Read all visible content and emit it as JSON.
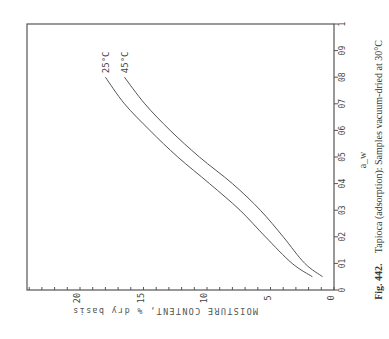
{
  "figure": {
    "caption_number": "Fig. 442.",
    "caption_text": "Tapioca (adsorption): Samples vacuum-dried at 30°C",
    "orientation": "rotated 90° clockwise"
  },
  "chart_data": {
    "type": "line",
    "title": "Tapioca (adsorption): Samples vacuum-dried at 30°C",
    "xlabel": "a_w",
    "ylabel": "MOISTURE CONTENT, % dry basis",
    "xlim": [
      0,
      1
    ],
    "ylim": [
      0,
      24
    ],
    "x_ticks": [
      0,
      0.1,
      0.2,
      0.3,
      0.4,
      0.5,
      0.6,
      0.7,
      0.8,
      0.9,
      1
    ],
    "x_tick_labels": [
      "0",
      "01",
      "02",
      "03",
      "04",
      "05",
      "06",
      "07",
      "08",
      "09",
      "1"
    ],
    "y_ticks": [
      0,
      5,
      10,
      15,
      20
    ],
    "y_tick_labels": [
      "0",
      "5",
      "10",
      "15",
      "20"
    ],
    "y_minor_step": 1,
    "grid": false,
    "legend": "inline labels at curve ends",
    "series": [
      {
        "name": "25°C",
        "x": [
          0.05,
          0.1,
          0.2,
          0.3,
          0.4,
          0.5,
          0.6,
          0.7,
          0.8
        ],
        "values": [
          1.7,
          3.3,
          5.4,
          7.4,
          9.8,
          12.3,
          14.5,
          16.5,
          18.0
        ]
      },
      {
        "name": "45°C",
        "x": [
          0.05,
          0.1,
          0.2,
          0.3,
          0.4,
          0.5,
          0.6,
          0.7,
          0.8
        ],
        "values": [
          0.9,
          2.3,
          4.0,
          5.8,
          8.0,
          10.6,
          12.9,
          14.9,
          16.5
        ]
      }
    ]
  },
  "layout": {
    "frame": {
      "left": 27,
      "top": 24,
      "right": 334,
      "bottom": 290
    },
    "moisture_px_per_unit": 12.7,
    "line_color": "#555555",
    "text_color": "#444444"
  }
}
